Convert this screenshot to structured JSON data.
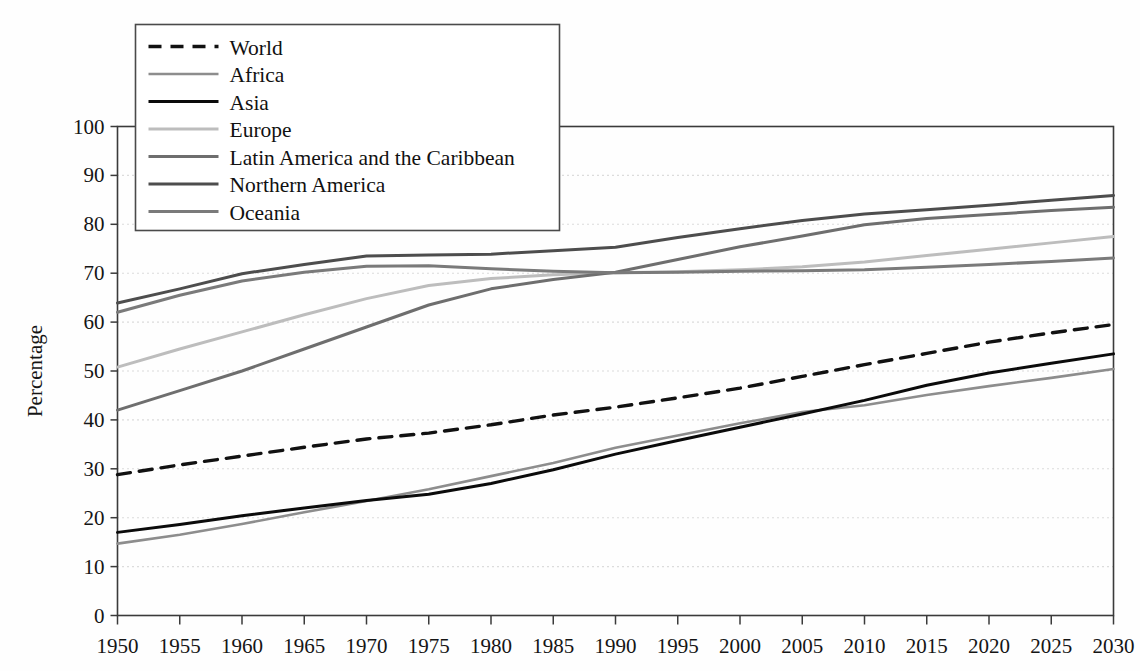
{
  "chart_data": {
    "type": "line",
    "title": "",
    "xlabel": "",
    "ylabel": "Percentage",
    "xlim": [
      1950,
      2030
    ],
    "ylim": [
      0,
      100
    ],
    "grid": true,
    "legend_position": "top-left",
    "x": [
      1950,
      1955,
      1960,
      1965,
      1970,
      1975,
      1980,
      1985,
      1990,
      1995,
      2000,
      2005,
      2010,
      2015,
      2020,
      2025,
      2030
    ],
    "xtick_labels": [
      "1950",
      "1955",
      "1960",
      "1965",
      "1970",
      "1975",
      "1980",
      "1985",
      "1990",
      "1995",
      "2000",
      "2005",
      "2010",
      "2015",
      "2020",
      "2025",
      "2030"
    ],
    "ytick_labels": [
      "0",
      "10",
      "20",
      "30",
      "40",
      "50",
      "60",
      "70",
      "80",
      "90",
      "100"
    ],
    "ytick_values": [
      0,
      10,
      20,
      30,
      40,
      50,
      60,
      70,
      80,
      90,
      100
    ],
    "series": [
      {
        "name": "World",
        "style": "dashed",
        "color": "#111111",
        "width": 3.4,
        "values": [
          28.8,
          30.8,
          32.6,
          34.4,
          36.1,
          37.3,
          39.0,
          41.0,
          42.6,
          44.5,
          46.5,
          48.9,
          51.3,
          53.6,
          55.9,
          57.8,
          59.5
        ]
      },
      {
        "name": "Africa",
        "style": "solid",
        "color": "#8d8d8d",
        "width": 2.6,
        "values": [
          14.7,
          16.5,
          18.7,
          21.1,
          23.4,
          25.8,
          28.5,
          31.2,
          34.3,
          36.8,
          39.3,
          41.6,
          43.0,
          45.1,
          46.9,
          48.6,
          50.4
        ]
      },
      {
        "name": "Asia",
        "style": "solid",
        "color": "#0b0b0b",
        "width": 3.0,
        "values": [
          17.0,
          18.6,
          20.4,
          22.0,
          23.5,
          24.8,
          27.0,
          29.8,
          33.0,
          35.8,
          38.5,
          41.2,
          44.0,
          47.1,
          49.6,
          51.6,
          53.5
        ]
      },
      {
        "name": "Europe",
        "style": "solid",
        "color": "#bdbdbd",
        "width": 3.0,
        "values": [
          50.8,
          54.5,
          58.0,
          61.5,
          64.8,
          67.5,
          68.9,
          69.7,
          70.1,
          70.3,
          70.7,
          71.3,
          72.3,
          73.6,
          74.9,
          76.2,
          77.5
        ]
      },
      {
        "name": "Latin America and the Caribbean",
        "style": "solid",
        "color": "#6e6e6e",
        "width": 3.0,
        "values": [
          42.0,
          46.0,
          50.0,
          54.5,
          59.0,
          63.5,
          66.8,
          68.7,
          70.2,
          72.8,
          75.4,
          77.6,
          79.9,
          81.2,
          82.0,
          82.8,
          83.5
        ]
      },
      {
        "name": "Northern America",
        "style": "solid",
        "color": "#4d4d4d",
        "width": 3.0,
        "values": [
          63.9,
          66.8,
          69.9,
          71.8,
          73.5,
          73.7,
          73.9,
          74.6,
          75.3,
          77.3,
          79.1,
          80.8,
          82.1,
          83.0,
          83.9,
          84.9,
          85.9
        ]
      },
      {
        "name": "Oceania",
        "style": "solid",
        "color": "#7a7a7a",
        "width": 3.0,
        "values": [
          62.0,
          65.5,
          68.4,
          70.2,
          71.4,
          71.5,
          70.9,
          70.4,
          70.1,
          70.2,
          70.4,
          70.5,
          70.7,
          71.2,
          71.8,
          72.4,
          73.1
        ]
      }
    ]
  },
  "legend": {
    "entries": [
      {
        "label": "World"
      },
      {
        "label": "Africa"
      },
      {
        "label": "Asia"
      },
      {
        "label": "Europe"
      },
      {
        "label": "Latin America and the Caribbean"
      },
      {
        "label": "Northern America"
      },
      {
        "label": "Oceania"
      }
    ]
  }
}
